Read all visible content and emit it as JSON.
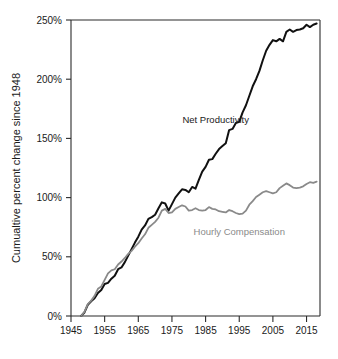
{
  "chart_data": {
    "type": "line",
    "title": "",
    "xlabel": "",
    "ylabel": "Cumualtive percent change since 1948",
    "xlim": [
      1945,
      2019
    ],
    "ylim": [
      0,
      250
    ],
    "grid": false,
    "legend_position": "inline-annotations",
    "x_ticks": [
      "1945",
      "1955",
      "1965",
      "1975",
      "1985",
      "1995",
      "2005",
      "2015"
    ],
    "x_tick_values": [
      1945,
      1955,
      1965,
      1975,
      1985,
      1995,
      2005,
      2015
    ],
    "y_ticks": [
      "0%",
      "50%",
      "100%",
      "150%",
      "200%",
      "250%"
    ],
    "y_tick_values": [
      0,
      50,
      100,
      150,
      200,
      250
    ],
    "annotations": [
      {
        "text": "Net Productivity",
        "x": 1988,
        "y": 163,
        "color": "#1a1a1a"
      },
      {
        "text": "Hourly Compensation",
        "x": 1995,
        "y": 68,
        "color": "#8a8a8a"
      }
    ],
    "series": [
      {
        "name": "Net Productivity",
        "color": "#111111",
        "width": 2.0,
        "x": [
          1948,
          1949,
          1950,
          1951,
          1952,
          1953,
          1954,
          1955,
          1956,
          1957,
          1958,
          1959,
          1960,
          1961,
          1962,
          1963,
          1964,
          1965,
          1966,
          1967,
          1968,
          1969,
          1970,
          1971,
          1972,
          1973,
          1974,
          1975,
          1976,
          1977,
          1978,
          1979,
          1980,
          1981,
          1982,
          1983,
          1984,
          1985,
          1986,
          1987,
          1988,
          1989,
          1990,
          1991,
          1992,
          1993,
          1994,
          1995,
          1996,
          1997,
          1998,
          1999,
          2000,
          2001,
          2002,
          2003,
          2004,
          2005,
          2006,
          2007,
          2008,
          2009,
          2010,
          2011,
          2012,
          2013,
          2014,
          2015,
          2016,
          2017,
          2018
        ],
        "values": [
          0,
          3.0,
          9.5,
          12.5,
          15.0,
          19.5,
          22.0,
          27.0,
          28.0,
          31.5,
          34.0,
          39.5,
          41.0,
          45.5,
          51.0,
          56.5,
          62.0,
          67.0,
          73.0,
          76.5,
          82.0,
          83.5,
          85.5,
          91.0,
          96.0,
          95.0,
          89.0,
          94.5,
          100.0,
          103.5,
          107.0,
          106.5,
          104.5,
          109.0,
          107.5,
          115.0,
          122.0,
          126.0,
          132.0,
          132.5,
          137.0,
          141.0,
          143.5,
          146.0,
          157.0,
          158.0,
          163.0,
          164.0,
          172.0,
          178.0,
          186.0,
          194.0,
          200.0,
          207.0,
          216.0,
          224.0,
          229.0,
          233.0,
          232.0,
          234.0,
          232.0,
          240.0,
          242.0,
          240.0,
          241.5,
          242.0,
          243.0,
          246.0,
          244.0,
          246.0,
          247.0
        ]
      },
      {
        "name": "Hourly Compensation",
        "color": "#8a8a8a",
        "width": 1.8,
        "x": [
          1948,
          1949,
          1950,
          1951,
          1952,
          1953,
          1954,
          1955,
          1956,
          1957,
          1958,
          1959,
          1960,
          1961,
          1962,
          1963,
          1964,
          1965,
          1966,
          1967,
          1968,
          1969,
          1970,
          1971,
          1972,
          1973,
          1974,
          1975,
          1976,
          1977,
          1978,
          1979,
          1980,
          1981,
          1982,
          1983,
          1984,
          1985,
          1986,
          1987,
          1988,
          1989,
          1990,
          1991,
          1992,
          1993,
          1994,
          1995,
          1996,
          1997,
          1998,
          1999,
          2000,
          2001,
          2002,
          2003,
          2004,
          2005,
          2006,
          2007,
          2008,
          2009,
          2010,
          2011,
          2012,
          2013,
          2014,
          2015,
          2016,
          2017,
          2018
        ],
        "values": [
          0,
          3.5,
          10.0,
          13.0,
          17.0,
          23.0,
          25.0,
          30.5,
          36.0,
          38.5,
          39.5,
          43.5,
          46.0,
          49.0,
          52.5,
          55.0,
          58.5,
          61.5,
          65.5,
          69.0,
          74.5,
          77.0,
          79.5,
          83.0,
          89.0,
          90.5,
          87.0,
          87.5,
          90.5,
          92.0,
          93.5,
          92.5,
          89.0,
          89.5,
          91.0,
          89.5,
          89.0,
          89.5,
          92.0,
          90.5,
          90.0,
          88.5,
          88.0,
          87.5,
          89.5,
          88.5,
          87.0,
          86.0,
          86.5,
          89.0,
          94.0,
          97.0,
          100.5,
          102.5,
          104.5,
          105.5,
          104.5,
          103.5,
          104.5,
          108.0,
          110.0,
          112.0,
          110.5,
          108.5,
          108.0,
          108.5,
          109.5,
          111.5,
          113.0,
          112.5,
          113.5
        ]
      }
    ]
  },
  "layout": {
    "plot_left": 71,
    "plot_right": 320,
    "plot_top": 20,
    "plot_bottom": 316
  }
}
